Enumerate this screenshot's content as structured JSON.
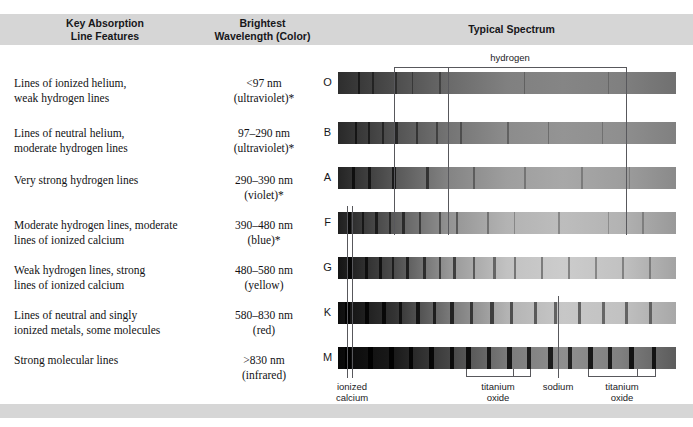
{
  "figure": {
    "columns": [
      {
        "id": "key-absorption",
        "line1": "Key Absorption",
        "line2": "Line Features"
      },
      {
        "id": "brightest-wavelength",
        "line1": "Brightest",
        "line2": "Wavelength (Color)"
      },
      {
        "id": "typical-spectrum",
        "line1": "Typical Spectrum",
        "line2": ""
      }
    ],
    "hydrogen_label": "hydrogen",
    "bottom_labels": [
      {
        "id": "ionized-calcium",
        "line1": "ionized",
        "line2": "calcium"
      },
      {
        "id": "titanium-oxide-left",
        "line1": "titanium",
        "line2": "oxide"
      },
      {
        "id": "sodium",
        "line1": "sodium",
        "line2": ""
      },
      {
        "id": "titanium-oxide-right",
        "line1": "titanium",
        "line2": "oxide"
      }
    ],
    "rows": [
      {
        "class": "O",
        "features_line1": "Lines of ionized helium,",
        "features_line2": "weak hydrogen lines",
        "wavelength": "<97 nm",
        "color": "(ultraviolet)*"
      },
      {
        "class": "B",
        "features_line1": "Lines of neutral helium,",
        "features_line2": "moderate hydrogen lines",
        "wavelength": "97–290 nm",
        "color": "(ultraviolet)*"
      },
      {
        "class": "A",
        "features_line1": "Very strong hydrogen lines",
        "features_line2": "",
        "wavelength": "290–390 nm",
        "color": "(violet)*"
      },
      {
        "class": "F",
        "features_line1": "Moderate hydrogen lines, moderate",
        "features_line2": "lines of ionized calcium",
        "wavelength": "390–480 nm",
        "color": "(blue)*"
      },
      {
        "class": "G",
        "features_line1": "Weak hydrogen lines, strong",
        "features_line2": "lines of ionized calcium",
        "wavelength": "480–580 nm",
        "color": "(yellow)"
      },
      {
        "class": "K",
        "features_line1": "Lines of neutral and singly",
        "features_line2": "ionized metals, some molecules",
        "wavelength": "580–830 nm",
        "color": "(red)"
      },
      {
        "class": "M",
        "features_line1": "Strong molecular lines",
        "features_line2": "",
        "wavelength": ">830 nm",
        "color": "(infrared)"
      }
    ],
    "colors": {
      "band": "#d6d6d6",
      "rule": "#58585c",
      "text": "#121214",
      "page": "#ffffff"
    }
  },
  "chart_data": {
    "type": "heatmap",
    "xlabel": "",
    "ylabel": "",
    "categories": [
      "O",
      "B",
      "A",
      "F",
      "G",
      "K",
      "M"
    ],
    "series": [
      {
        "name": "Brightest wavelength range (nm)",
        "values": [
          "<97",
          "97–290",
          "290–390",
          "390–480",
          "480–580",
          "580–830",
          ">830"
        ]
      },
      {
        "name": "Perceived color",
        "values": [
          "ultraviolet",
          "ultraviolet",
          "violet",
          "blue",
          "yellow",
          "red",
          "infrared"
        ]
      },
      {
        "name": "Overall continuum brightness trend (blue end → red end, 0=dark 1=bright)",
        "values": [
          [
            0.18,
            0.3,
            0.42,
            0.5,
            0.52,
            0.5,
            0.44
          ],
          [
            0.16,
            0.32,
            0.46,
            0.55,
            0.58,
            0.56,
            0.5
          ],
          [
            0.14,
            0.34,
            0.52,
            0.62,
            0.66,
            0.62,
            0.54
          ],
          [
            0.12,
            0.36,
            0.58,
            0.7,
            0.74,
            0.7,
            0.6
          ],
          [
            0.08,
            0.3,
            0.6,
            0.76,
            0.8,
            0.76,
            0.64
          ],
          [
            0.05,
            0.2,
            0.48,
            0.7,
            0.78,
            0.76,
            0.66
          ],
          [
            0.03,
            0.1,
            0.28,
            0.48,
            0.56,
            0.5,
            0.36
          ]
        ]
      }
    ],
    "annotations": [
      {
        "label": "hydrogen",
        "type": "bracket",
        "x_start_px": 394,
        "x_end_px": 626,
        "ticks_px": [
          394,
          448,
          626
        ]
      },
      {
        "label": "ionized calcium",
        "type": "double-line",
        "x_px": [
          347,
          352
        ]
      },
      {
        "label": "titanium oxide",
        "type": "bracket",
        "x_start_px": 466,
        "x_end_px": 530,
        "ticks_px": [
          466,
          513,
          530
        ]
      },
      {
        "label": "sodium",
        "type": "line",
        "x_px": [
          558
        ]
      },
      {
        "label": "titanium oxide",
        "type": "bracket",
        "x_start_px": 588,
        "x_end_px": 655,
        "ticks_px": [
          588,
          637,
          655
        ]
      }
    ],
    "legend": "none",
    "grid": false,
    "note": "Absorption-line strengths vary by class: O/B show helium lines, A peaks in hydrogen, F/G show ionized calcium, K/M show metals and molecular TiO bands."
  }
}
